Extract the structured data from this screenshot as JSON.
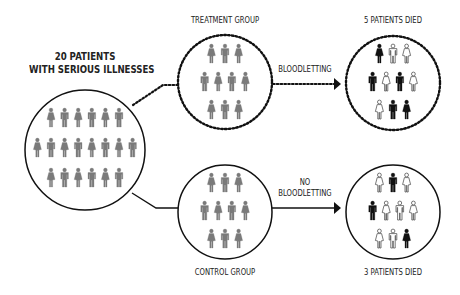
{
  "title_label": {
    "line1": "20 PATIENTS",
    "line2": "WITH SERIOUS ILLNESSES"
  },
  "groups": {
    "treatment": {
      "label": "TREATMENT GROUP",
      "border": "dotted"
    },
    "control": {
      "label": "CONTROL GROUP",
      "border": "solid"
    }
  },
  "arrows": {
    "treatment": {
      "label_lines": [
        "BLOODLETTING"
      ],
      "style": "dotted"
    },
    "control": {
      "label_lines": [
        "NO",
        "BLOODLETTING"
      ],
      "style": "solid"
    }
  },
  "outcomes": {
    "treatment": {
      "label": "5 PATIENTS DIED",
      "died": 5,
      "total": 10
    },
    "control": {
      "label": "3 PATIENTS DIED",
      "died": 3,
      "total": 10
    }
  },
  "colors": {
    "alive_gray": "#7a7a7a",
    "died_black": "#111111",
    "survived_outline": "#ffffff",
    "line": "#111111",
    "text": "#222222"
  },
  "figures": {
    "all_patients": {
      "rows": [
        [
          "F",
          "M",
          "F",
          "M",
          "F",
          "M"
        ],
        [
          "F",
          "M",
          "F",
          "M",
          "F",
          "M",
          "F",
          "M"
        ],
        [
          "F",
          "M",
          "F",
          "M",
          "F",
          "M"
        ]
      ]
    },
    "treatment_group": {
      "rows": [
        [
          "F",
          "M",
          "F"
        ],
        [
          "M",
          "F",
          "M",
          "F"
        ],
        [
          "F",
          "M",
          "F"
        ]
      ]
    },
    "treatment_outcome": {
      "rows": [
        [
          {
            "s": "F",
            "state": "died"
          },
          {
            "s": "M",
            "state": "survived"
          },
          {
            "s": "F",
            "state": "survived"
          }
        ],
        [
          {
            "s": "M",
            "state": "died"
          },
          {
            "s": "F",
            "state": "survived"
          },
          {
            "s": "M",
            "state": "died"
          },
          {
            "s": "F",
            "state": "survived"
          }
        ],
        [
          {
            "s": "F",
            "state": "survived"
          },
          {
            "s": "M",
            "state": "died"
          },
          {
            "s": "F",
            "state": "died"
          }
        ]
      ]
    },
    "control_group": {
      "rows": [
        [
          "F",
          "M",
          "F"
        ],
        [
          "M",
          "F",
          "M",
          "F"
        ],
        [
          "F",
          "M",
          "F"
        ]
      ]
    },
    "control_outcome": {
      "rows": [
        [
          {
            "s": "F",
            "state": "survived"
          },
          {
            "s": "M",
            "state": "died"
          },
          {
            "s": "F",
            "state": "survived"
          }
        ],
        [
          {
            "s": "M",
            "state": "died"
          },
          {
            "s": "F",
            "state": "survived"
          },
          {
            "s": "M",
            "state": "survived"
          },
          {
            "s": "F",
            "state": "survived"
          }
        ],
        [
          {
            "s": "F",
            "state": "survived"
          },
          {
            "s": "M",
            "state": "survived"
          },
          {
            "s": "F",
            "state": "died"
          }
        ]
      ]
    }
  }
}
